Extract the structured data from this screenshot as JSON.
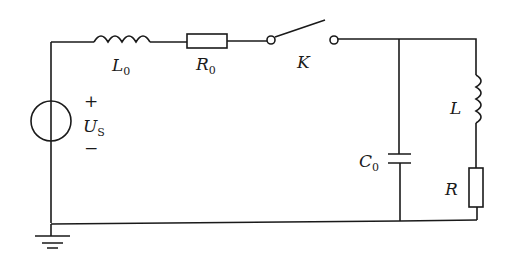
{
  "diagram": {
    "type": "circuit",
    "components": {
      "source": {
        "symbol": "U",
        "subscript": "S",
        "plus": "+",
        "minus": "−"
      },
      "inductor_series": {
        "symbol": "L",
        "subscript": "0"
      },
      "resistor_series": {
        "symbol": "R",
        "subscript": "0"
      },
      "switch": {
        "symbol": "K"
      },
      "capacitor": {
        "symbol": "C",
        "subscript": "0"
      },
      "inductor_branch": {
        "symbol": "L"
      },
      "resistor_branch": {
        "symbol": "R"
      }
    },
    "colors": {
      "line": "#1a1a1a",
      "background": "#ffffff"
    }
  }
}
